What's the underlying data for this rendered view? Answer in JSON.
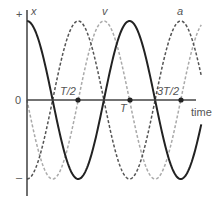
{
  "chart_data": {
    "type": "line",
    "title": "",
    "xlabel": "time",
    "ylabel": "",
    "y_tick_labels": [
      "+",
      "0",
      "–"
    ],
    "x_tick_labels": [
      "T/2",
      "T",
      "3T/2"
    ],
    "x_tick_values": [
      0.5,
      1.0,
      1.5
    ],
    "xlim": [
      0,
      1.7
    ],
    "ylim": [
      -1,
      1
    ],
    "grid": false,
    "series": [
      {
        "name": "x",
        "style": "solid",
        "color": "#222222",
        "formula": "cos(2πt/T)",
        "x": [
          0,
          0.25,
          0.5,
          0.75,
          1.0,
          1.25,
          1.5,
          1.7
        ],
        "values": [
          1,
          0,
          -1,
          0,
          1,
          0,
          -1,
          -0.31
        ]
      },
      {
        "name": "v",
        "style": "dashed",
        "color": "#aaaaaa",
        "formula": "-sin(2πt/T)",
        "x": [
          0,
          0.25,
          0.5,
          0.75,
          1.0,
          1.25,
          1.5,
          1.7
        ],
        "values": [
          0,
          -1,
          0,
          1,
          0,
          -1,
          0,
          0.95
        ]
      },
      {
        "name": "a",
        "style": "dashed",
        "color": "#555555",
        "formula": "-cos(2πt/T)",
        "x": [
          0,
          0.25,
          0.5,
          0.75,
          1.0,
          1.25,
          1.5,
          1.7
        ],
        "values": [
          -1,
          0,
          1,
          0,
          -1,
          0,
          1,
          0.31
        ]
      }
    ],
    "markers": [
      {
        "label": "T/2",
        "x": 0.5
      },
      {
        "label": "T",
        "x": 1.0
      },
      {
        "label": "3T/2",
        "x": 1.5
      }
    ]
  },
  "labels": {
    "plus": "+",
    "zero": "0",
    "minus": "–",
    "x": "x",
    "v": "v",
    "a": "a",
    "half": "T/2",
    "full": "T",
    "threehalf": "3T/2",
    "time": "time"
  }
}
